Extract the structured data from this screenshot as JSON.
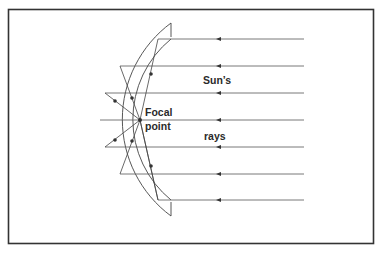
{
  "diagram": {
    "type": "concave-mirror-ray-diagram",
    "labels": {
      "focal_line1": "Focal",
      "focal_line2": "point",
      "suns": "Sun’s",
      "rays": "rays"
    },
    "ray_count": 7,
    "ray_direction": "right-to-left",
    "colors": {
      "frame": "#333333",
      "lines": "#444444",
      "background": "#ffffff"
    }
  }
}
